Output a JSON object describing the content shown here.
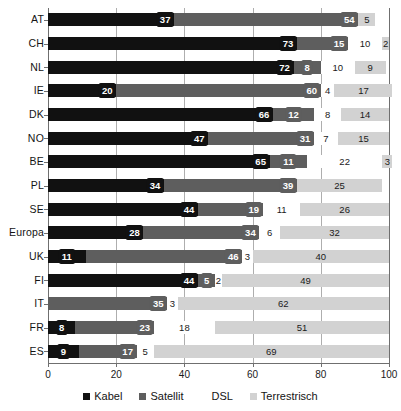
{
  "chart_data": {
    "type": "bar",
    "orientation": "horizontal",
    "stacked": true,
    "title": "",
    "subtitle": "",
    "xlabel": "",
    "ylabel": "",
    "xlim": [
      0,
      100
    ],
    "xticks": [
      0,
      20,
      40,
      60,
      80,
      100
    ],
    "xtick_labels": [
      "0",
      "20",
      "40",
      "60",
      "80",
      "100"
    ],
    "grid": "vertical",
    "legend_position": "bottom",
    "categories": [
      "AT",
      "CH",
      "NL",
      "IE",
      "DK",
      "NO",
      "BE",
      "PL",
      "SE",
      "Europa",
      "UK",
      "FI",
      "IT",
      "FR",
      "ES"
    ],
    "series": [
      {
        "name": "Kabel",
        "color": "#111111",
        "values": [
          37,
          73,
          72,
          20,
          66,
          47,
          65,
          34,
          44,
          28,
          11,
          44,
          0,
          8,
          9
        ]
      },
      {
        "name": "Satellit",
        "color": "#5e5e5e",
        "values": [
          54,
          15,
          8,
          60,
          12,
          31,
          11,
          39,
          19,
          34,
          46,
          5,
          35,
          23,
          17
        ]
      },
      {
        "name": "DSL",
        "color": "#ffffff",
        "values": [
          0,
          10,
          10,
          4,
          8,
          7,
          22,
          0,
          11,
          6,
          3,
          2,
          3,
          18,
          5
        ]
      },
      {
        "name": "Terrestrisch",
        "color": "#d2d2d2",
        "values": [
          5,
          2,
          9,
          17,
          14,
          15,
          3,
          25,
          26,
          32,
          40,
          49,
          62,
          51,
          69
        ]
      }
    ],
    "data_labels": {
      "AT": [
        "37",
        "54",
        "",
        "5"
      ],
      "CH": [
        "73",
        "15",
        "10",
        "2"
      ],
      "NL": [
        "72",
        "8",
        "10",
        "9"
      ],
      "IE": [
        "20",
        "60",
        "4",
        "17"
      ],
      "DK": [
        "66",
        "12",
        "8",
        "14"
      ],
      "NO": [
        "47",
        "31",
        "7",
        "15"
      ],
      "BE": [
        "65",
        "11",
        "22",
        "3"
      ],
      "PL": [
        "34",
        "39",
        "",
        "25"
      ],
      "SE": [
        "44",
        "19",
        "11",
        "26"
      ],
      "Europa": [
        "28",
        "34",
        "6",
        "32"
      ],
      "UK": [
        "11",
        "46",
        "3",
        "40"
      ],
      "FI": [
        "44",
        "5",
        "2",
        "49"
      ],
      "IT": [
        "",
        "35",
        "3",
        "62"
      ],
      "FR": [
        "8",
        "23",
        "18",
        "51"
      ],
      "ES": [
        "9",
        "17",
        "5",
        "69"
      ]
    },
    "legend": [
      {
        "label": "Kabel",
        "color": "#111111"
      },
      {
        "label": "Satellit",
        "color": "#5e5e5e"
      },
      {
        "label": "DSL",
        "color": "#ffffff"
      },
      {
        "label": "Terrestrisch",
        "color": "#d2d2d2"
      }
    ]
  }
}
